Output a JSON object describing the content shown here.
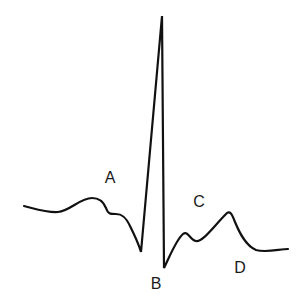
{
  "diagram": {
    "type": "ecg-waveform",
    "stroke_color": "#111111",
    "background_color": "#ffffff",
    "labels": [
      {
        "id": "A",
        "text": "A",
        "x": 110,
        "y": 178
      },
      {
        "id": "B",
        "text": "B",
        "x": 156,
        "y": 284
      },
      {
        "id": "C",
        "text": "C",
        "x": 199,
        "y": 202
      },
      {
        "id": "D",
        "text": "D",
        "x": 240,
        "y": 268
      }
    ]
  }
}
